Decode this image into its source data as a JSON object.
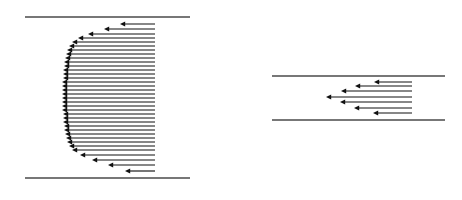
{
  "figure": {
    "background_color": "#ffffff",
    "wall_color": "#4a4a4a",
    "arrow_color": "#111111",
    "canvas": {
      "width": 462,
      "height": 200
    }
  },
  "chart_data": {
    "type": "line",
    "subtitle": "",
    "xlabel": "",
    "ylabel": "",
    "grid": false,
    "legend_position": "none",
    "annotations": [],
    "panels": [
      {
        "name": "turbulent-velocity-profile",
        "label": "Turbulent (flat / plug) velocity profile",
        "flow_direction": "leftward",
        "wall_top": {
          "x1": 25,
          "x2": 190,
          "y": 17
        },
        "wall_bottom": {
          "x1": 25,
          "x2": 190,
          "y": 178
        },
        "arrow_tail_x": 155,
        "arrow_count": 35,
        "profile_shape": "flat-top-with-steep-near-wall-gradient",
        "arrows": [
          {
            "y": 24,
            "tip_x": 120,
            "length": 35
          },
          {
            "y": 29,
            "tip_x": 104,
            "length": 51
          },
          {
            "y": 34,
            "tip_x": 88,
            "length": 67
          },
          {
            "y": 38,
            "tip_x": 78,
            "length": 77
          },
          {
            "y": 42,
            "tip_x": 72,
            "length": 83
          },
          {
            "y": 46,
            "tip_x": 69,
            "length": 86
          },
          {
            "y": 50,
            "tip_x": 67,
            "length": 88
          },
          {
            "y": 54,
            "tip_x": 66,
            "length": 89
          },
          {
            "y": 58,
            "tip_x": 65,
            "length": 90
          },
          {
            "y": 62,
            "tip_x": 64,
            "length": 91
          },
          {
            "y": 66,
            "tip_x": 64,
            "length": 91
          },
          {
            "y": 70,
            "tip_x": 63,
            "length": 92
          },
          {
            "y": 74,
            "tip_x": 63,
            "length": 92
          },
          {
            "y": 78,
            "tip_x": 63,
            "length": 92
          },
          {
            "y": 82,
            "tip_x": 62,
            "length": 93
          },
          {
            "y": 86,
            "tip_x": 62,
            "length": 93
          },
          {
            "y": 90,
            "tip_x": 62,
            "length": 93
          },
          {
            "y": 94,
            "tip_x": 62,
            "length": 93
          },
          {
            "y": 98,
            "tip_x": 62,
            "length": 93
          },
          {
            "y": 102,
            "tip_x": 62,
            "length": 93
          },
          {
            "y": 106,
            "tip_x": 62,
            "length": 93
          },
          {
            "y": 110,
            "tip_x": 62,
            "length": 93
          },
          {
            "y": 114,
            "tip_x": 63,
            "length": 92
          },
          {
            "y": 118,
            "tip_x": 63,
            "length": 92
          },
          {
            "y": 122,
            "tip_x": 63,
            "length": 92
          },
          {
            "y": 126,
            "tip_x": 64,
            "length": 91
          },
          {
            "y": 130,
            "tip_x": 64,
            "length": 91
          },
          {
            "y": 134,
            "tip_x": 65,
            "length": 90
          },
          {
            "y": 138,
            "tip_x": 66,
            "length": 89
          },
          {
            "y": 142,
            "tip_x": 67,
            "length": 88
          },
          {
            "y": 146,
            "tip_x": 69,
            "length": 86
          },
          {
            "y": 150,
            "tip_x": 72,
            "length": 83
          },
          {
            "y": 155,
            "tip_x": 80,
            "length": 75
          },
          {
            "y": 160,
            "tip_x": 92,
            "length": 63
          },
          {
            "y": 165,
            "tip_x": 108,
            "length": 47
          },
          {
            "y": 171,
            "tip_x": 125,
            "length": 30
          }
        ]
      },
      {
        "name": "laminar-velocity-profile",
        "label": "Laminar (parabolic) velocity profile",
        "flow_direction": "leftward",
        "wall_top": {
          "x1": 272,
          "x2": 445,
          "y": 76
        },
        "wall_bottom": {
          "x1": 272,
          "x2": 445,
          "y": 120
        },
        "arrow_tail_x": 412,
        "arrow_count": 7,
        "profile_shape": "parabolic",
        "arrows": [
          {
            "y": 82,
            "tip_x": 374,
            "length": 38
          },
          {
            "y": 86,
            "tip_x": 355,
            "length": 57
          },
          {
            "y": 91,
            "tip_x": 341,
            "length": 71
          },
          {
            "y": 97,
            "tip_x": 326,
            "length": 86
          },
          {
            "y": 102,
            "tip_x": 340,
            "length": 72
          },
          {
            "y": 108,
            "tip_x": 354,
            "length": 58
          },
          {
            "y": 113,
            "tip_x": 373,
            "length": 39
          }
        ]
      }
    ]
  }
}
